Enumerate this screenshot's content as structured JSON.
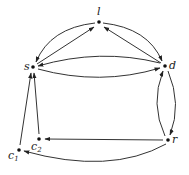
{
  "diagram": {
    "type": "directed-graph",
    "nodes": [
      {
        "id": "l",
        "label": "l",
        "x": 99,
        "y": 22
      },
      {
        "id": "s",
        "label": "s",
        "x": 33,
        "y": 67
      },
      {
        "id": "d",
        "label": "d",
        "x": 165,
        "y": 66
      },
      {
        "id": "r",
        "label": "r",
        "x": 168,
        "y": 140
      },
      {
        "id": "c2",
        "label": "c",
        "sub": "2",
        "x": 39,
        "y": 139
      },
      {
        "id": "c1",
        "label": "c",
        "sub": "1",
        "x": 19,
        "y": 150
      }
    ],
    "edges": [
      {
        "from": "l",
        "to": "s",
        "curved": true
      },
      {
        "from": "s",
        "to": "l",
        "curved": false
      },
      {
        "from": "l",
        "to": "d",
        "curved": true
      },
      {
        "from": "d",
        "to": "l",
        "curved": false
      },
      {
        "from": "d",
        "to": "s",
        "curved": true
      },
      {
        "from": "s",
        "to": "d",
        "curved": true
      },
      {
        "from": "d",
        "to": "r",
        "curved": true
      },
      {
        "from": "r",
        "to": "d",
        "curved": true
      },
      {
        "from": "r",
        "to": "c2",
        "curved": false
      },
      {
        "from": "r",
        "to": "c1",
        "curved": true
      },
      {
        "from": "c2",
        "to": "s",
        "curved": false
      },
      {
        "from": "c1",
        "to": "s",
        "curved": false
      }
    ]
  }
}
